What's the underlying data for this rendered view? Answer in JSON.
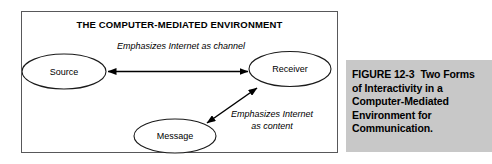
{
  "figure": {
    "diagram_title": "THE COMPUTER-MEDIATED ENVIRONMENT",
    "nodes": [
      {
        "id": "source",
        "label": "Source"
      },
      {
        "id": "receiver",
        "label": "Receiver"
      },
      {
        "id": "message",
        "label": "Message"
      }
    ],
    "edge_labels": {
      "channel": "Emphasizes Internet as channel",
      "content_line1": "Emphasizes Internet",
      "content_line2": "as content"
    },
    "border_color": "#58585a"
  },
  "caption": {
    "label": "FIGURE 12-3",
    "line1": "Two Forms",
    "line2": "of Interactivity in a",
    "line3": "Computer-Mediated",
    "line4": "Environment for",
    "line5": "Communication.",
    "background_color": "#c8c8c8"
  }
}
